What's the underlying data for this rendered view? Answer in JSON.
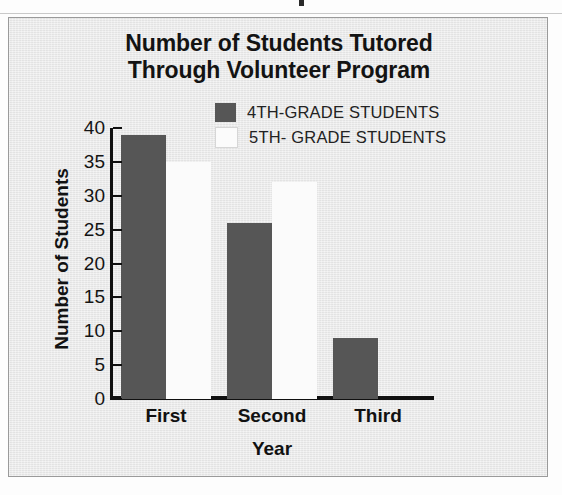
{
  "chart_data": {
    "type": "bar",
    "title": "Number of Students Tutored Through Volunteer Program",
    "title_lines": [
      "Number of Students Tutored",
      "Through Volunteer Program"
    ],
    "categories": [
      "First",
      "Second",
      "Third"
    ],
    "series": [
      {
        "name": "4TH-GRADE STUDENTS",
        "color": "#565656",
        "values": [
          39,
          26,
          9
        ]
      },
      {
        "name": "5TH- GRADE STUDENTS",
        "color": "#fbfbfb",
        "values": [
          35,
          32,
          0
        ]
      }
    ],
    "xlabel": "Year",
    "ylabel": "Number of Students",
    "ylim": [
      0,
      40
    ],
    "ytick_labels": [
      "40",
      "35",
      "30",
      "25",
      "20",
      "15",
      "10",
      "5",
      "0"
    ],
    "ytick_values": [
      40,
      35,
      30,
      25,
      20,
      15,
      10,
      5,
      0
    ],
    "ytick_step": 5,
    "grid": false,
    "legend_position": "top-right"
  },
  "colors": {
    "frame_background": "#e9e9e9",
    "frame_border": "#9a9a9a",
    "axis": "#101010",
    "text": "#131313",
    "series_4th": "#565656",
    "series_5th": "#fbfbfb"
  }
}
